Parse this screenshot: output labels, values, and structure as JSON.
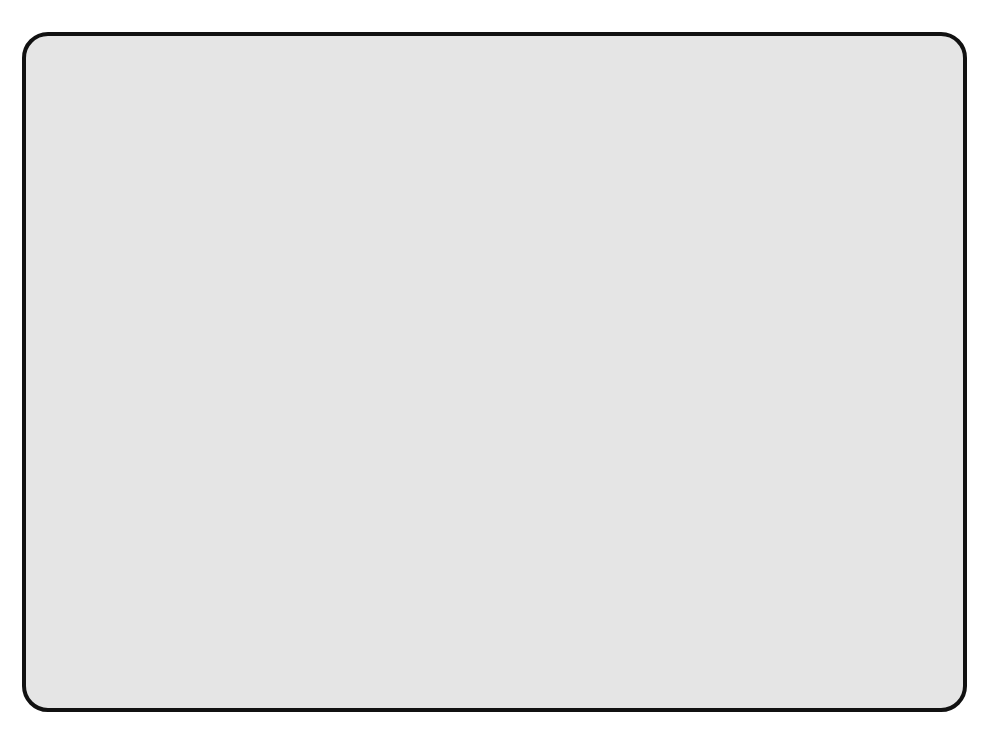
{
  "figure": {
    "panel_background": "#e5e5e5",
    "panel_border_color": "#111111",
    "plot_background": "#ffffff",
    "partial_title": "",
    "legend": {
      "marker": "filled-square",
      "marker_color": "#000000",
      "label": "observed medians"
    }
  },
  "chart_data": {
    "type": "scatter",
    "title": "",
    "xlabel": "Gestational age (completed weeks)",
    "ylabel": "PAPP-A (mIU/ml)",
    "xlim": [
      7,
      15
    ],
    "ylim": [
      0.1,
      20.0
    ],
    "yscale": "log",
    "xticks": [
      7,
      8,
      9,
      10,
      11,
      12,
      13,
      14,
      15
    ],
    "xtick_labels": [
      "7",
      "8",
      "9",
      "10",
      "11",
      "12",
      "13",
      "14",
      "15"
    ],
    "yticks": [
      20.0,
      10.0,
      5.0,
      2.0,
      1.0,
      0.5,
      0.2,
      0.1
    ],
    "ytick_labels": [
      "20.0",
      "10.0",
      "5.0",
      "2.0",
      "1.0",
      "0.5",
      "0.2",
      "0.1"
    ],
    "grid": true,
    "legend_position": "lower right",
    "series": [
      {
        "name": "observed medians",
        "style": "markers",
        "marker": "square",
        "color": "#000000",
        "x": [
          8,
          9,
          10,
          11,
          12,
          13,
          14
        ],
        "y": [
          0.95,
          1.3,
          2.05,
          2.6,
          2.95,
          3.1,
          7.0
        ]
      },
      {
        "name": "fitted median",
        "style": "solid-line",
        "color": "#000000",
        "x": [
          8,
          14
        ],
        "y": [
          0.95,
          6.3
        ]
      },
      {
        "name": "upper bound",
        "style": "dashed-line",
        "color": "#000000",
        "x": [
          8,
          14
        ],
        "y": [
          1.8,
          12.0
        ]
      },
      {
        "name": "lower bound",
        "style": "dashed-line",
        "color": "#000000",
        "x": [
          8,
          14
        ],
        "y": [
          0.52,
          2.4
        ]
      }
    ]
  }
}
